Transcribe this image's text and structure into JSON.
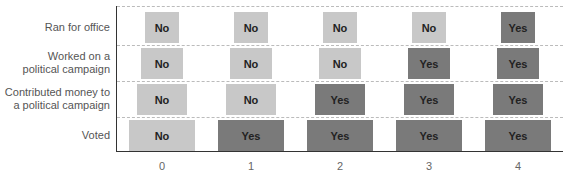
{
  "chart_data": {
    "type": "table",
    "title": "",
    "xlabel": "",
    "ylabel": "",
    "categories": [
      "0",
      "1",
      "2",
      "3",
      "4"
    ],
    "rows": [
      {
        "label": "Ran for office",
        "values": [
          "No",
          "No",
          "No",
          "No",
          "Yes"
        ]
      },
      {
        "label": "Worked on a\npolitical campaign",
        "values": [
          "No",
          "No",
          "No",
          "Yes",
          "Yes"
        ]
      },
      {
        "label": "Contributed money to\na political campaign",
        "values": [
          "No",
          "No",
          "Yes",
          "Yes",
          "Yes"
        ]
      },
      {
        "label": "Voted",
        "values": [
          "No",
          "Yes",
          "Yes",
          "Yes",
          "Yes"
        ]
      }
    ],
    "colors": {
      "no": "#c8c8c8",
      "yes": "#7a7a7a"
    },
    "grid": "dashed horizontal",
    "legend": "none"
  }
}
